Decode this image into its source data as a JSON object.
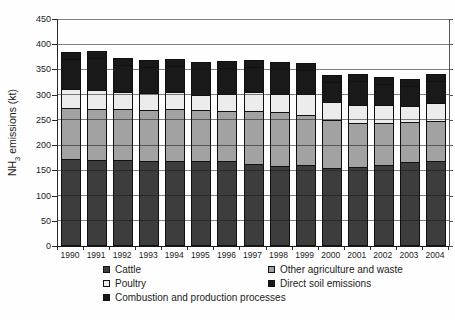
{
  "figure": {
    "ylabel_prefix": "NH",
    "ylabel_sub": "3",
    "ylabel_suffix": " emissions (kt)"
  },
  "chart_data": {
    "type": "bar",
    "stacked": true,
    "title": "",
    "xlabel": "",
    "ylabel": "NH3 emissions (kt)",
    "ylim": [
      0,
      450
    ],
    "ytick_step": 50,
    "grid": true,
    "legend_position": "bottom",
    "categories": [
      "1990",
      "1991",
      "1992",
      "1993",
      "1994",
      "1995",
      "1996",
      "1997",
      "1998",
      "1999",
      "2000",
      "2001",
      "2002",
      "2003",
      "2004"
    ],
    "series": [
      {
        "name": "Cattle",
        "color": "#3d3d3d",
        "values": [
          170,
          168,
          168,
          166,
          167,
          166,
          167,
          161,
          157,
          158,
          153,
          155,
          159,
          165,
          167
        ]
      },
      {
        "name": "Other agriculture and waste",
        "color": "#a2a2a2",
        "values": [
          102,
          101,
          101,
          101,
          102,
          101,
          99,
          105,
          106,
          100,
          94,
          87,
          82,
          79,
          79
        ]
      },
      {
        "name": "Poultry",
        "color": "#ececec",
        "values": [
          38,
          39,
          34,
          35,
          34,
          31,
          34,
          38,
          37,
          42,
          36,
          36,
          36,
          32,
          36
        ]
      },
      {
        "name": "Direct soil emissions",
        "color": "#191919",
        "values": [
          58,
          62,
          53,
          50,
          52,
          50,
          50,
          49,
          48,
          47,
          41,
          48,
          43,
          40,
          44
        ]
      },
      {
        "name": "Combustion and production processes",
        "color": "#181818",
        "values": [
          14,
          14,
          14,
          14,
          14,
          14,
          14,
          14,
          14,
          14,
          14,
          14,
          14,
          14,
          14
        ]
      }
    ],
    "totals": [
      382,
      384,
      370,
      366,
      369,
      362,
      364,
      367,
      362,
      361,
      338,
      340,
      334,
      330,
      340
    ]
  }
}
